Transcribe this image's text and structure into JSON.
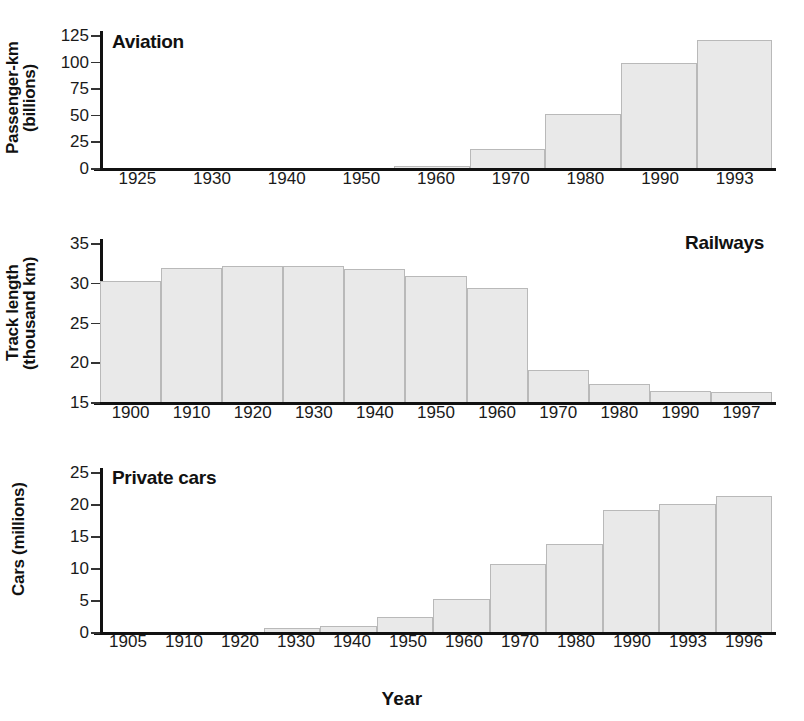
{
  "figure": {
    "xaxis_title": "Year",
    "bar_fill": "#e9e9e9",
    "bar_stroke": "#b9b9b9",
    "axis_color": "#111111"
  },
  "chart_data": [
    {
      "type": "bar",
      "title": "Aviation",
      "ylabel": "Passenger-km\n(billions)",
      "xlabel": "Year",
      "categories": [
        "1925",
        "1930",
        "1940",
        "1950",
        "1960",
        "1970",
        "1980",
        "1990",
        "1993"
      ],
      "values": [
        0,
        0,
        0,
        0.5,
        2,
        18,
        51,
        99,
        120
      ],
      "yticks": [
        0,
        25,
        50,
        75,
        100,
        125
      ],
      "ylim": [
        0,
        125
      ],
      "grid": false,
      "legend": "none"
    },
    {
      "type": "bar",
      "title": "Railways",
      "ylabel": "Track length\n(thousand km)",
      "xlabel": "Year",
      "categories": [
        "1900",
        "1910",
        "1920",
        "1930",
        "1940",
        "1950",
        "1960",
        "1970",
        "1980",
        "1990",
        "1997"
      ],
      "values": [
        30.2,
        31.8,
        32.1,
        32.1,
        31.7,
        30.9,
        29.4,
        19.0,
        17.3,
        16.4,
        16.3
      ],
      "yticks": [
        15,
        20,
        25,
        30,
        35
      ],
      "ylim": [
        15,
        35
      ],
      "grid": false,
      "legend": "none"
    },
    {
      "type": "bar",
      "title": "Private cars",
      "ylabel": "Cars (millions)",
      "xlabel": "Year",
      "categories": [
        "1905",
        "1910",
        "1920",
        "1930",
        "1940",
        "1950",
        "1960",
        "1970",
        "1980",
        "1990",
        "1993",
        "1996"
      ],
      "values": [
        0,
        0,
        0,
        0.6,
        1.0,
        2.3,
        5.2,
        10.6,
        13.8,
        19.0,
        20.0,
        21.3
      ],
      "yticks": [
        0,
        5,
        10,
        15,
        20,
        25
      ],
      "ylim": [
        0,
        25
      ],
      "grid": false,
      "legend": "none"
    }
  ]
}
